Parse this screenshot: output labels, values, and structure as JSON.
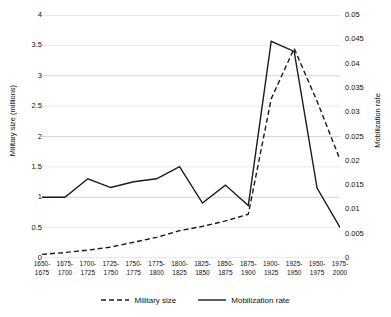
{
  "chart_data": {
    "type": "line",
    "title": "",
    "xlabel": "",
    "categories": [
      "1650-1675",
      "1675-1700",
      "1700-1725",
      "1725-1750",
      "1750-1775",
      "1775-1800",
      "1800-1825",
      "1825-1850",
      "1850-1875",
      "1875-1900",
      "1900-1925",
      "1925-1950",
      "1950-1975",
      "1975-2000"
    ],
    "grid": true,
    "legend_position": "bottom",
    "axes": {
      "left": {
        "label": "Military size (millions)",
        "min": 0,
        "max": 4,
        "step": 0.5,
        "ticks": [
          "0",
          "0.5",
          "1",
          "1.5",
          "2",
          "2.5",
          "3",
          "3.5",
          "4"
        ]
      },
      "right": {
        "label": "Mobilization rate",
        "min": 0,
        "max": 0.05,
        "step": 0.005,
        "ticks": [
          "0",
          "0.005",
          "0.01",
          "0.015",
          "0.02",
          "0.025",
          "0.03",
          "0.035",
          "0.04",
          "0.045",
          "0.05"
        ]
      }
    },
    "series": [
      {
        "name": "Military size",
        "axis": "left",
        "style": "dashed",
        "color": "#1a1a1a",
        "values": [
          0.06,
          0.09,
          0.13,
          0.18,
          0.26,
          0.34,
          0.45,
          0.52,
          0.61,
          0.72,
          2.62,
          3.45,
          2.58,
          1.62
        ]
      },
      {
        "name": "Mobilization rate",
        "axis": "right",
        "style": "solid",
        "color": "#1a1a1a",
        "values": [
          0.0125,
          0.0125,
          0.0163,
          0.0145,
          0.0157,
          0.0163,
          0.0188,
          0.0113,
          0.015,
          0.0108,
          0.0446,
          0.0425,
          0.0144,
          0.0063
        ]
      }
    ]
  },
  "legend": {
    "items": [
      {
        "label": "Military size",
        "style": "dashed"
      },
      {
        "label": "Mobilization rate",
        "style": "solid"
      }
    ]
  }
}
